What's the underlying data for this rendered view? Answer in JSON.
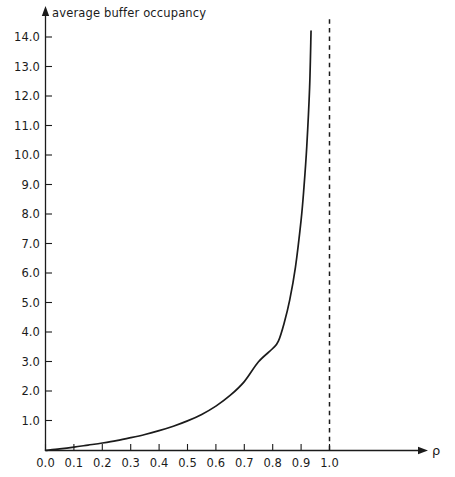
{
  "figure": {
    "background_color": "#ffffff",
    "ink_color": "#1b1b1b",
    "x_axis_title": "ρ",
    "y_axis_title": "average buffer occupancy",
    "bottom_sliver_text": ""
  },
  "chart_data": {
    "type": "line",
    "title": "",
    "subtitle": "",
    "xlabel": "ρ",
    "ylabel": "average buffer occupancy",
    "xlim": [
      0.0,
      1.0
    ],
    "ylim": [
      0.0,
      15.0
    ],
    "grid": false,
    "legend": false,
    "legend_position": "none",
    "x_tick_labels": [
      "0.0",
      "0.1",
      "0.2",
      "0.3",
      "0.4",
      "0.5",
      "0.6",
      "0.7",
      "0.8",
      "0.9",
      "1.0"
    ],
    "x_ticks": [
      0.0,
      0.1,
      0.2,
      0.3,
      0.4,
      0.5,
      0.6,
      0.7,
      0.8,
      0.9,
      1.0
    ],
    "y_tick_labels": [
      "1.0",
      "2.0",
      "3.0",
      "4.0",
      "5.0",
      "6.0",
      "7.0",
      "8.0",
      "9.0",
      "10.0",
      "11.0",
      "12.0",
      "13.0",
      "14.0"
    ],
    "y_ticks": [
      1.0,
      2.0,
      3.0,
      4.0,
      5.0,
      6.0,
      7.0,
      8.0,
      9.0,
      10.0,
      11.0,
      12.0,
      13.0,
      14.0
    ],
    "series": [
      {
        "name": "average buffer occupancy",
        "style": "solid",
        "color": "#1b1b1b",
        "x": [
          0.0,
          0.05,
          0.1,
          0.15,
          0.2,
          0.25,
          0.3,
          0.35,
          0.4,
          0.45,
          0.5,
          0.55,
          0.6,
          0.65,
          0.7,
          0.75,
          0.8,
          0.82,
          0.84,
          0.86,
          0.88,
          0.9,
          0.91,
          0.92,
          0.93,
          0.935
        ],
        "values": [
          0.0,
          0.05,
          0.11,
          0.18,
          0.25,
          0.33,
          0.43,
          0.54,
          0.67,
          0.82,
          1.0,
          1.22,
          1.5,
          1.86,
          2.33,
          3.0,
          3.45,
          3.7,
          4.3,
          5.1,
          6.2,
          7.8,
          8.9,
          10.3,
          12.3,
          14.2
        ]
      }
    ],
    "annotations": [
      {
        "name": "saturation-asymptote",
        "type": "vertical-dashed-line",
        "x": 1.0,
        "label": ""
      }
    ]
  }
}
